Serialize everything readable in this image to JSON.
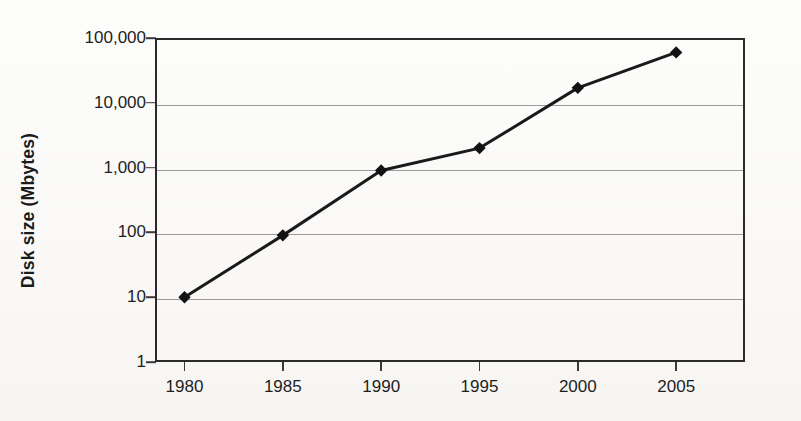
{
  "chart_data": {
    "type": "line",
    "title": "",
    "subtitle": "",
    "xlabel": "",
    "ylabel": "Disk size (Mbytes)",
    "x": [
      1980,
      1985,
      1990,
      1995,
      2000,
      2005
    ],
    "categories": [
      "1980",
      "1985",
      "1990",
      "1995",
      "2000",
      "2005"
    ],
    "values": [
      10,
      90,
      900,
      2000,
      17000,
      60000
    ],
    "series": [
      {
        "name": "Disk size",
        "values": [
          10,
          90,
          900,
          2000,
          17000,
          60000
        ]
      }
    ],
    "xtick_labels": [
      "1980",
      "1985",
      "1990",
      "1995",
      "2000",
      "2005"
    ],
    "ytick_labels": [
      "100,000",
      "10,000",
      "1,000",
      "100",
      "10",
      "1"
    ],
    "ytick_values": [
      100000,
      10000,
      1000,
      100,
      10,
      1
    ],
    "yscale": "log",
    "xscale": "linear",
    "ylim": [
      1,
      100000
    ],
    "xlim": [
      1978.5,
      2008.5
    ],
    "grid": true,
    "grid_axis": "y",
    "legend": false,
    "legend_position": "none",
    "marker": "diamond",
    "marker_color": "#111111",
    "line_color": "#1a1a1a",
    "line_width": 3,
    "annotations": []
  },
  "figure": {
    "background_color": "#fbfaf8",
    "axis_color": "#2a2a2a",
    "grid_color": "#9a9a9a",
    "text_color": "#1e1e1e"
  }
}
